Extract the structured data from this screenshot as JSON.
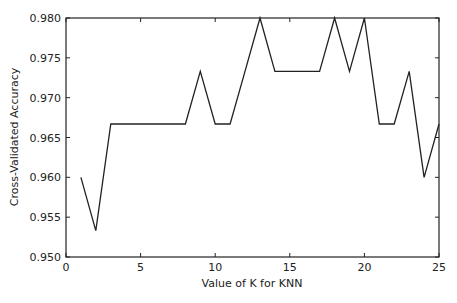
{
  "chart_data": {
    "type": "line",
    "title": "",
    "xlabel": "Value of K for KNN",
    "ylabel": "Cross-Validated Accuracy",
    "xlim": [
      0,
      25
    ],
    "ylim": [
      0.95,
      0.98
    ],
    "xticks": [
      0,
      5,
      10,
      15,
      20,
      25
    ],
    "yticks": [
      "0.950",
      "0.955",
      "0.960",
      "0.965",
      "0.970",
      "0.975",
      "0.980"
    ],
    "grid": false,
    "legend": null,
    "x": [
      1,
      2,
      3,
      4,
      5,
      6,
      7,
      8,
      9,
      10,
      11,
      12,
      13,
      14,
      15,
      16,
      17,
      18,
      19,
      20,
      21,
      22,
      23,
      24,
      25
    ],
    "series": [
      {
        "name": "accuracy",
        "color": "#222222",
        "values": [
          0.96,
          0.9533,
          0.9667,
          0.9667,
          0.9667,
          0.9667,
          0.9667,
          0.9667,
          0.9733,
          0.9667,
          0.9667,
          0.9733,
          0.98,
          0.9733,
          0.9733,
          0.9733,
          0.9733,
          0.98,
          0.9733,
          0.98,
          0.9667,
          0.9667,
          0.9733,
          0.96,
          0.9667
        ]
      }
    ]
  }
}
